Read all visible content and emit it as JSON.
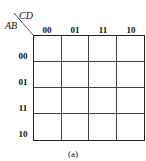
{
  "kmap": {
    "column_variable": "CD",
    "row_variable": "AB",
    "column_labels": [
      "00",
      "01",
      "11",
      "10"
    ],
    "row_labels": [
      "00",
      "01",
      "11",
      "10"
    ],
    "cells": [
      [
        "",
        "",
        "",
        ""
      ],
      [
        "",
        "",
        "",
        ""
      ],
      [
        "",
        "",
        "",
        ""
      ],
      [
        "",
        "",
        "",
        ""
      ]
    ],
    "caption": "(a)"
  }
}
